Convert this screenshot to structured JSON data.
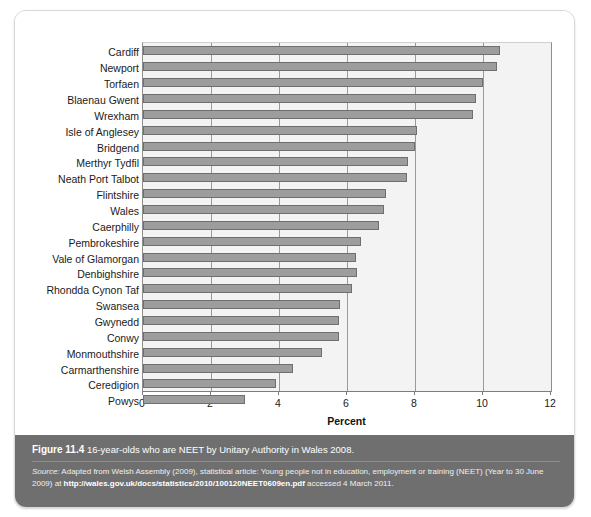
{
  "figure": {
    "caption_label": "Figure 11.4",
    "caption_text": "16-year-olds who are NEET by Unitary Authority in Wales 2008.",
    "source_label": "Source:",
    "source_text_1": " Adapted from Welsh Assembly (2009), statistical article: Young people not in education, employment or training (NEET) (Year to 30 June 2009) at ",
    "source_url": "http://wales.gov.uk/docs/statistics/2010/100120NEET0609en.pdf",
    "source_text_2": " accessed 4 March 2011."
  },
  "chart_data": {
    "type": "bar",
    "orientation": "horizontal",
    "title": "",
    "xlabel": "Percent",
    "ylabel": "",
    "xlim": [
      0,
      12
    ],
    "xticks": [
      0,
      2,
      4,
      6,
      8,
      10,
      12
    ],
    "grid": true,
    "legend": "none",
    "colors": {
      "bar_fill": "#9d9d9d",
      "bar_edge": "#6f6f6f",
      "plot_background": "#f3f3f3",
      "caption_band": "#6f6f6f"
    },
    "categories": [
      "Cardiff",
      "Newport",
      "Torfaen",
      "Blaenau Gwent",
      "Wrexham",
      "Isle of Anglesey",
      "Bridgend",
      "Merthyr Tydfil",
      "Neath Port Talbot",
      "Flintshire",
      "Wales",
      "Caerphilly",
      "Pembrokeshire",
      "Vale of Glamorgan",
      "Denbighshire",
      "Rhondda Cynon Taf",
      "Swansea",
      "Gwynedd",
      "Conwy",
      "Monmouthshire",
      "Carmarthenshire",
      "Ceredigion",
      "Powys"
    ],
    "values": [
      10.5,
      10.4,
      10.0,
      9.8,
      9.7,
      8.05,
      8.0,
      7.8,
      7.75,
      7.15,
      7.1,
      6.95,
      6.4,
      6.25,
      6.3,
      6.15,
      5.8,
      5.75,
      5.75,
      5.25,
      4.4,
      3.9,
      3.0
    ]
  }
}
